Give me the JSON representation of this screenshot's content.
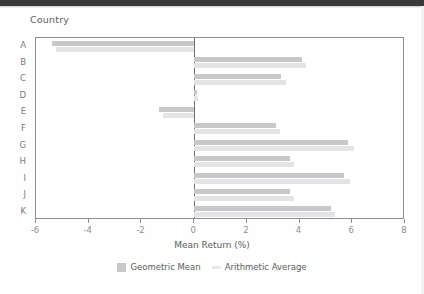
{
  "chart_title": "Country",
  "axis": {
    "x_title": "Mean Return (%)",
    "x_ticks": [
      "-6",
      "-4",
      "-2",
      "0",
      "2",
      "4",
      "6",
      "8"
    ],
    "x_tick_values": [
      -6,
      -4,
      -2,
      0,
      2,
      4,
      6,
      8
    ],
    "y_ticks": [
      "A",
      "B",
      "C",
      "D",
      "E",
      "F",
      "G",
      "H",
      "I",
      "J",
      "K"
    ]
  },
  "legend": {
    "position": "bottom-center",
    "items": [
      {
        "label": "Geometric Mean",
        "color": "#c8c8cb",
        "marker": "square-swatch"
      },
      {
        "label": "Arithmetic Average",
        "color": "#e9e9eb",
        "marker": "line-swatch"
      }
    ]
  },
  "chart_data": {
    "type": "bar",
    "orientation": "horizontal",
    "title": "Country",
    "xlabel": "Mean Return (%)",
    "ylabel": "Country",
    "xlim": [
      -6,
      8
    ],
    "grid": false,
    "legend_position": "bottom",
    "categories": [
      "A",
      "B",
      "C",
      "D",
      "E",
      "F",
      "G",
      "H",
      "I",
      "J",
      "K"
    ],
    "series": [
      {
        "name": "Geometric Mean",
        "color": "#c8c8cb",
        "values": [
          -5.4,
          4.1,
          3.3,
          0.1,
          -1.35,
          3.1,
          5.85,
          3.65,
          5.7,
          3.65,
          5.2
        ]
      },
      {
        "name": "Arithmetic Average",
        "color": "#e4e4e6",
        "values": [
          -5.25,
          4.25,
          3.5,
          0.15,
          -1.2,
          3.25,
          6.05,
          3.8,
          5.9,
          3.8,
          5.35
        ]
      }
    ]
  }
}
